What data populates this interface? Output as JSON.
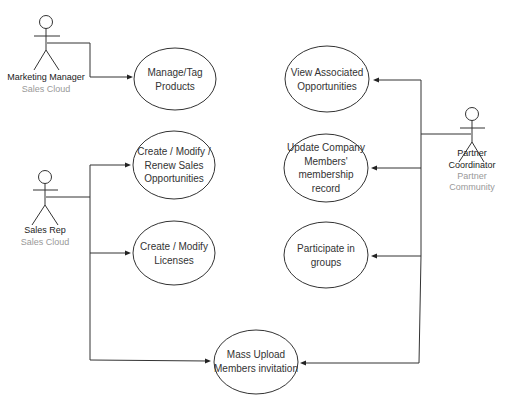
{
  "actors": [
    {
      "id": "marketing-manager",
      "name": "Marketing Manager",
      "system": "Sales Cloud"
    },
    {
      "id": "sales-rep",
      "name": "Sales Rep",
      "system": "Sales Cloud"
    },
    {
      "id": "partner-coordinator",
      "name": "Partner Coordinator",
      "system": "Partner Community"
    }
  ],
  "use_cases": [
    {
      "id": "manage-tag-products",
      "lines": [
        "Manage/Tag",
        "Products"
      ]
    },
    {
      "id": "create-modify-renew-opps",
      "lines": [
        "Create / Modify /",
        "Renew Sales",
        "Opportunities"
      ]
    },
    {
      "id": "create-modify-licenses",
      "lines": [
        "Create / Modify",
        "Licenses"
      ]
    },
    {
      "id": "mass-upload-invitation",
      "lines": [
        "Mass Upload",
        "Members invitation"
      ]
    },
    {
      "id": "view-associated-opps",
      "lines": [
        "View Associated",
        "Opportunities"
      ]
    },
    {
      "id": "update-membership-record",
      "lines": [
        "Update Company",
        "Members'",
        "membership",
        "record"
      ]
    },
    {
      "id": "participate-groups",
      "lines": [
        "Participate in",
        "groups"
      ]
    }
  ],
  "associations": [
    {
      "from": "marketing-manager",
      "to": "manage-tag-products"
    },
    {
      "from": "sales-rep",
      "to": "create-modify-renew-opps"
    },
    {
      "from": "sales-rep",
      "to": "create-modify-licenses"
    },
    {
      "from": "sales-rep",
      "to": "mass-upload-invitation"
    },
    {
      "from": "partner-coordinator",
      "to": "view-associated-opps"
    },
    {
      "from": "partner-coordinator",
      "to": "update-membership-record"
    },
    {
      "from": "partner-coordinator",
      "to": "participate-groups"
    },
    {
      "from": "partner-coordinator",
      "to": "mass-upload-invitation"
    }
  ]
}
